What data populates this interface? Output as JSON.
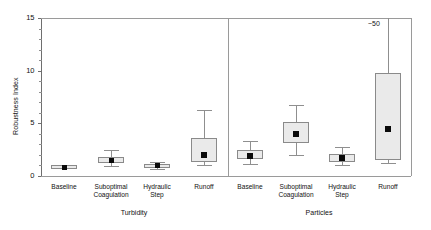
{
  "chart_data": {
    "type": "box",
    "title": "",
    "xlabel": "",
    "ylabel": "Robustness Index",
    "ylim": [
      0,
      15
    ],
    "yticks": [
      0,
      5,
      10,
      15
    ],
    "ytick_labels": [
      "0",
      "5",
      "10",
      "15"
    ],
    "minor_tick_step": 1,
    "grid": false,
    "legend": "none",
    "panels": [
      {
        "name": "Turbidity",
        "categories": [
          "Baseline",
          "Suboptimal Coagulation",
          "Hydraulic Step",
          "Runoff"
        ],
        "boxes": [
          {
            "category": "Baseline",
            "whisker_low": 0.75,
            "q1": 0.8,
            "median": 0.9,
            "q3": 1.0,
            "whisker_high": 1.05,
            "off_scale": false
          },
          {
            "category": "Suboptimal Coagulation",
            "whisker_low": 0.95,
            "q1": 1.25,
            "median": 1.5,
            "q3": 1.85,
            "whisker_high": 2.45,
            "off_scale": false
          },
          {
            "category": "Hydraulic Step",
            "whisker_low": 0.7,
            "q1": 0.85,
            "median": 1.0,
            "q3": 1.15,
            "whisker_high": 1.35,
            "off_scale": false
          },
          {
            "category": "Runoff",
            "whisker_low": 1.0,
            "q1": 1.3,
            "median": 2.0,
            "q3": 3.6,
            "whisker_high": 6.3,
            "off_scale": false
          }
        ]
      },
      {
        "name": "Particles",
        "categories": [
          "Baseline",
          "Suboptimal Coagulation",
          "Hydraulic Step",
          "Runoff"
        ],
        "boxes": [
          {
            "category": "Baseline",
            "whisker_low": 1.1,
            "q1": 1.55,
            "median": 1.9,
            "q3": 2.45,
            "whisker_high": 3.3,
            "off_scale": false
          },
          {
            "category": "Suboptimal Coagulation",
            "whisker_low": 2.0,
            "q1": 3.1,
            "median": 4.0,
            "q3": 5.1,
            "whisker_high": 6.7,
            "off_scale": false
          },
          {
            "category": "Hydraulic Step",
            "whisker_low": 1.0,
            "q1": 1.35,
            "median": 1.7,
            "q3": 2.1,
            "whisker_high": 2.8,
            "off_scale": false
          },
          {
            "category": "Runoff",
            "whisker_low": 1.2,
            "q1": 1.5,
            "median": 4.5,
            "q3": 9.8,
            "whisker_high": 50.0,
            "off_scale": true,
            "annotation": "~50"
          }
        ]
      }
    ]
  },
  "axis": {
    "y_label": "Robustness Index",
    "y_tick_labels": [
      "0",
      "5",
      "10",
      "15"
    ]
  },
  "panels": {
    "turbidity": {
      "group_label": "Turbidity",
      "tick_labels": [
        {
          "line1": "Baseline",
          "line2": ""
        },
        {
          "line1": "Suboptimal",
          "line2": "Coagulation"
        },
        {
          "line1": "Hydraulic",
          "line2": "Step"
        },
        {
          "line1": "Runoff",
          "line2": ""
        }
      ]
    },
    "particles": {
      "group_label": "Particles",
      "tick_labels": [
        {
          "line1": "Baseline",
          "line2": ""
        },
        {
          "line1": "Suboptimal",
          "line2": "Coagulation"
        },
        {
          "line1": "Hydraulic",
          "line2": "Step"
        },
        {
          "line1": "Runoff",
          "line2": ""
        }
      ]
    }
  },
  "annotations": {
    "particles_runoff_max": "~50"
  },
  "colors": {
    "box_fill": "#eaeaea",
    "box_border": "#8a8a8a",
    "median": "#0a0a0a",
    "whisker": "#8f8f8f",
    "frame": "#9a9a9a",
    "text": "#111111"
  }
}
